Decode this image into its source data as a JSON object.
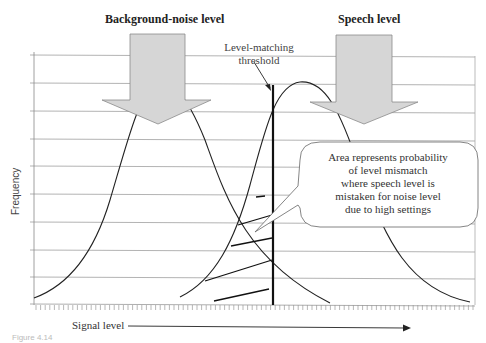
{
  "diagram": {
    "labels": {
      "background_noise": "Background-noise level",
      "speech": "Speech level",
      "threshold_line1": "Level-matching",
      "threshold_line2": "threshold",
      "y_axis": "Frequency",
      "x_axis": "Signal level",
      "caption": "Figure 4.14"
    },
    "callout": {
      "lines": [
        "Area represents probability",
        "of level mismatch",
        "where speech level is",
        "mistaken for noise level",
        "due to high settings"
      ]
    },
    "colors": {
      "arrow_fill": "#d4d4d4",
      "arrow_stroke": "#888888",
      "grid": "#9a9a9a",
      "curve": "#222222",
      "threshold": "#111111"
    }
  }
}
